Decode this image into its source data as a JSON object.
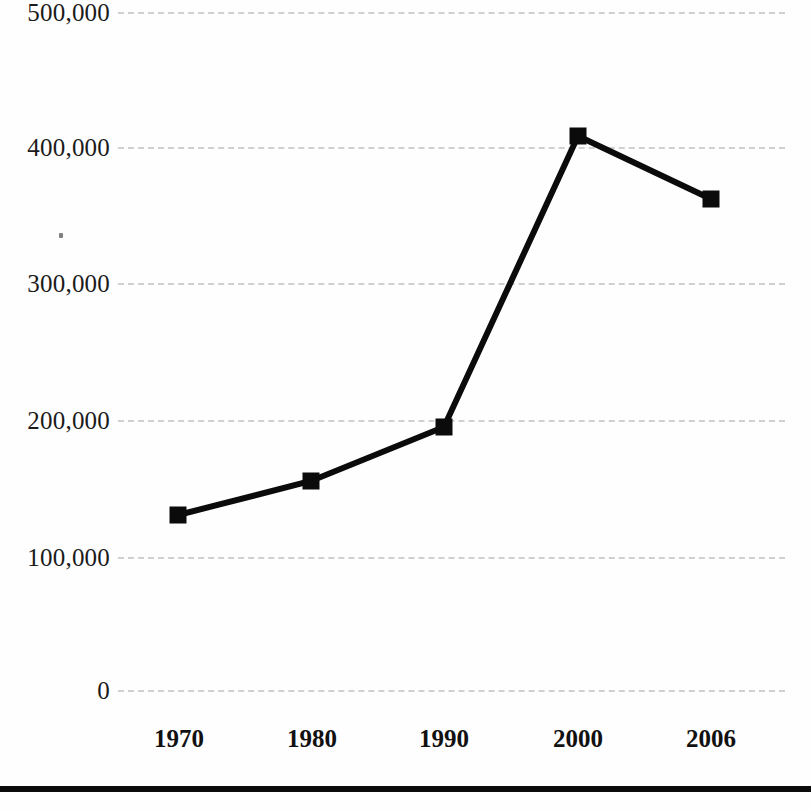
{
  "chart_data": {
    "type": "line",
    "title": "",
    "subtitle": "",
    "xlabel": "",
    "ylabel": "",
    "categories": [
      "1970",
      "1980",
      "1990",
      "2000",
      "2006"
    ],
    "values": [
      131000,
      157000,
      197000,
      408000,
      366000
    ],
    "series": [
      {
        "name": "",
        "values": [
          131000,
          157000,
          197000,
          408000,
          366000
        ]
      }
    ],
    "ylim": [
      0,
      500000
    ],
    "yticks": [
      0,
      100000,
      200000,
      300000,
      400000,
      500000
    ],
    "ytick_labels": [
      "0",
      "100,000",
      "200,000",
      "300,000",
      "400,000",
      "500,000"
    ],
    "xtick_labels": [
      "1970",
      "1980",
      "1990",
      "2000",
      "2006"
    ],
    "grid": true,
    "grid_axis": "y",
    "grid_style": "dashed",
    "legend": false,
    "legend_position": "none",
    "marker": "square",
    "annotations": []
  },
  "style": {
    "line_color": "#0b0b0b",
    "marker_color": "#0b0b0b",
    "grid_color": "#c9c9cc",
    "axis_text_color": "#1b1b1b",
    "background_color": "#fefefe",
    "rule_color": "#0b0b0b"
  },
  "axis": {
    "y_labels": [
      {
        "text": "500,000",
        "y": 12
      },
      {
        "text": "400,000",
        "y": 147
      },
      {
        "text": "300,000",
        "y": 283
      },
      {
        "text": "200,000",
        "y": 420
      },
      {
        "text": "100,000",
        "y": 557
      },
      {
        "text": "0",
        "y": 690
      }
    ],
    "x_labels": [
      {
        "text": "1970",
        "x": 179
      },
      {
        "text": "1980",
        "x": 312
      },
      {
        "text": "1990",
        "x": 444
      },
      {
        "text": "2000",
        "x": 578
      },
      {
        "text": "2006",
        "x": 711
      }
    ]
  },
  "geometry": {
    "points": [
      {
        "x": 178,
        "y": 515
      },
      {
        "x": 311,
        "y": 481
      },
      {
        "x": 444,
        "y": 427
      },
      {
        "x": 578,
        "y": 136
      },
      {
        "x": 711,
        "y": 199
      }
    ],
    "polyline": "178,515 311,481 444,427 578,136 711,199",
    "marker_size": 17,
    "line_width": 6
  }
}
